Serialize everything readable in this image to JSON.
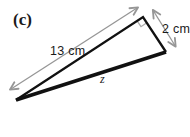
{
  "figure": {
    "label": "(c)"
  },
  "triangle": {
    "side_top_label": "13 cm",
    "side_right_label": "2 cm",
    "side_bottom_label": "z"
  },
  "colors": {
    "line": "#111111",
    "arrow": "#969696",
    "right_angle_marker": "#ababab",
    "text": "#1a1a1a",
    "background": "#ffffff"
  }
}
